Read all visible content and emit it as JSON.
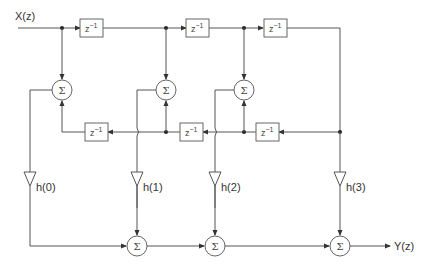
{
  "diagram": {
    "type": "fir-lattice-signal-flow",
    "input_label": "X(z)",
    "output_label": "Y(z)",
    "delay_label": "z",
    "delay_exponent": "−1",
    "sum_symbol": "Σ",
    "top_delays": [
      "z^-1",
      "z^-1",
      "z^-1"
    ],
    "bottom_delays": [
      "z^-1",
      "z^-1",
      "z^-1"
    ],
    "coefficients": [
      "h(0)",
      "h(1)",
      "h(2)",
      "h(3)"
    ],
    "nodes": {
      "adders_middle": 3,
      "adders_bottom": 3,
      "gains": 4
    }
  }
}
